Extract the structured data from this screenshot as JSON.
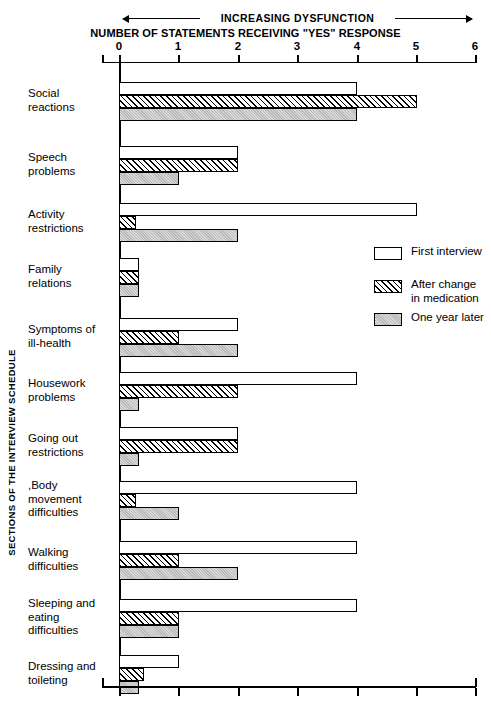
{
  "header": {
    "dysfunction_label": "INCREASING DYSFUNCTION",
    "axis_title": "NUMBER OF STATEMENTS RECEIVING \"YES\" RESPONSE",
    "y_axis_caption": "SECTIONS OF THE INTERVIEW SCHEDULE"
  },
  "axis": {
    "ticks": [
      "0",
      "1",
      "2",
      "3",
      "4",
      "5",
      "6"
    ]
  },
  "legend": {
    "items": [
      {
        "label": "First interview",
        "swatch": "white"
      },
      {
        "label": "After change\nin medication",
        "swatch": "hatched"
      },
      {
        "label": "One year later",
        "swatch": "gray"
      }
    ]
  },
  "chart_data": {
    "type": "bar",
    "orientation": "horizontal",
    "title": "NUMBER OF STATEMENTS RECEIVING \"YES\" RESPONSE",
    "xlabel": "NUMBER OF STATEMENTS RECEIVING \"YES\" RESPONSE",
    "ylabel": "SECTIONS OF THE INTERVIEW SCHEDULE",
    "annotation": "INCREASING DYSFUNCTION",
    "xlim": [
      0,
      6
    ],
    "xticks": [
      0,
      1,
      2,
      3,
      4,
      5,
      6
    ],
    "grid": false,
    "legend_position": "middle-right",
    "categories": [
      "Social\nreactions",
      "Speech\nproblems",
      "Activity\nrestrictions",
      "Family\nrelations",
      "Symptoms of\nill-health",
      "Housework\nproblems",
      "Going out\nrestrictions",
      ",Body\nmovement\ndifficulties",
      "Walking\ndifficulties",
      "Sleeping and\neating\ndifficulties",
      "Dressing and\ntoileting"
    ],
    "series": [
      {
        "name": "First interview",
        "values": [
          4,
          2,
          5,
          0.33,
          2,
          4,
          2,
          4,
          4,
          4,
          1
        ]
      },
      {
        "name": "After change in medication",
        "values": [
          5,
          2,
          0.28,
          0.33,
          1,
          2,
          2,
          0.28,
          1,
          1,
          0.42
        ]
      },
      {
        "name": "One year later",
        "values": [
          4,
          1,
          2,
          0.33,
          2,
          0.33,
          0.33,
          1,
          2,
          1,
          0.33
        ]
      }
    ]
  },
  "layout": {
    "group_tops": [
      82,
      146,
      203,
      258,
      318,
      372,
      427,
      481,
      541,
      599,
      655
    ],
    "bar_height": 13,
    "px_per_unit": 59.5,
    "x_zero": 119
  }
}
